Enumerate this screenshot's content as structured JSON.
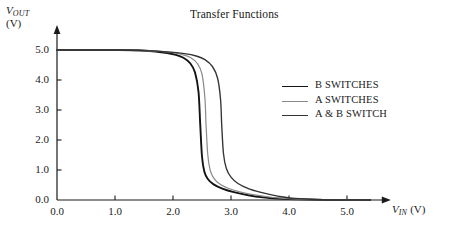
{
  "chart_data": {
    "type": "line",
    "title": "Transfer Functions",
    "xlabel": "V_IN (V)",
    "ylabel": "V_OUT (V)",
    "xlim": [
      0.0,
      5.6
    ],
    "ylim": [
      0.0,
      5.4
    ],
    "xticks": [
      "0.0",
      "1.0",
      "2.0",
      "3.0",
      "4.0",
      "5.0"
    ],
    "xtick_values": [
      0.0,
      1.0,
      2.0,
      3.0,
      4.0,
      5.0
    ],
    "yticks": [
      "0.0",
      "1.0",
      "2.0",
      "3.0",
      "4.0",
      "5.0"
    ],
    "ytick_values": [
      0.0,
      1.0,
      2.0,
      3.0,
      4.0,
      5.0
    ],
    "grid": false,
    "legend_position": "center-right",
    "series": [
      {
        "name": "B SWITCHES",
        "color": "#141414",
        "width": 1.9,
        "threshold": 2.47,
        "x": [
          0.0,
          0.5,
          1.0,
          1.4,
          1.7,
          1.9,
          2.05,
          2.18,
          2.3,
          2.38,
          2.44,
          2.47,
          2.5,
          2.54,
          2.6,
          2.7,
          2.85,
          3.05,
          3.3,
          3.55,
          3.8,
          4.2,
          4.8,
          5.4
        ],
        "y": [
          5.0,
          5.0,
          5.0,
          4.99,
          4.95,
          4.9,
          4.84,
          4.74,
          4.55,
          4.25,
          3.6,
          2.5,
          1.45,
          0.95,
          0.7,
          0.52,
          0.38,
          0.26,
          0.16,
          0.09,
          0.05,
          0.02,
          0.0,
          0.0
        ]
      },
      {
        "name": "A SWITCHES",
        "color": "#8a8a8a",
        "width": 1.2,
        "threshold": 2.57,
        "x": [
          0.0,
          0.5,
          1.0,
          1.4,
          1.75,
          2.0,
          2.15,
          2.3,
          2.42,
          2.5,
          2.55,
          2.57,
          2.6,
          2.64,
          2.7,
          2.8,
          2.95,
          3.15,
          3.4,
          3.65,
          3.9,
          4.3,
          4.9,
          5.4
        ],
        "y": [
          5.0,
          5.0,
          5.0,
          4.99,
          4.96,
          4.91,
          4.85,
          4.75,
          4.55,
          4.2,
          3.4,
          2.5,
          1.5,
          1.0,
          0.74,
          0.54,
          0.39,
          0.27,
          0.17,
          0.1,
          0.055,
          0.022,
          0.0,
          0.0
        ]
      },
      {
        "name": "A & B SWITCH",
        "color": "#333333",
        "width": 1.35,
        "threshold": 2.84,
        "x": [
          0.0,
          0.5,
          1.0,
          1.5,
          1.9,
          2.2,
          2.4,
          2.55,
          2.68,
          2.77,
          2.82,
          2.84,
          2.87,
          2.92,
          3.0,
          3.12,
          3.3,
          3.5,
          3.7,
          3.9,
          4.1,
          4.5,
          5.0,
          5.4
        ],
        "y": [
          5.0,
          5.0,
          5.0,
          4.98,
          4.94,
          4.88,
          4.8,
          4.68,
          4.45,
          4.05,
          3.35,
          2.5,
          1.55,
          1.05,
          0.76,
          0.55,
          0.38,
          0.26,
          0.17,
          0.1,
          0.055,
          0.018,
          0.0,
          0.0
        ]
      }
    ]
  },
  "labels": {
    "title": "Transfer Functions",
    "y_axis_symbol": "V",
    "y_axis_subscript": "OUT",
    "y_axis_units": "(V)",
    "x_axis_symbol": "V",
    "x_axis_subscript": "IN",
    "x_axis_units": "(V)"
  },
  "legend": {
    "entries": [
      {
        "label": "B SWITCHES",
        "color": "#141414"
      },
      {
        "label": "A SWITCHES",
        "color": "#8a8a8a"
      },
      {
        "label": "A & B SWITCH",
        "color": "#333333"
      }
    ]
  },
  "colors": {
    "background": "#ffffff",
    "axis": "#1a1a1a",
    "text": "#171717"
  }
}
